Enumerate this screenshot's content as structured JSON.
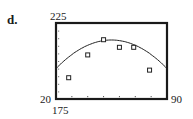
{
  "figure": {
    "part_label": "d.",
    "y_max_label": "225",
    "x_min_label": "20",
    "x_max_label": "90",
    "y_min_label": "175"
  },
  "chart_data": {
    "type": "scatter",
    "title": "",
    "xlabel": "",
    "ylabel": "",
    "xlim": [
      20,
      90
    ],
    "ylim": [
      175,
      225
    ],
    "x_ticks": [
      30,
      40,
      50,
      60,
      70,
      80
    ],
    "grid": false,
    "series": [
      {
        "name": "data points",
        "marker": "square",
        "x": [
          28,
          40,
          50,
          60,
          69,
          79
        ],
        "y": [
          189,
          204,
          214,
          209,
          209,
          194
        ]
      },
      {
        "name": "fitted quadratic curve",
        "style": "line",
        "x": [
          20,
          30,
          40,
          50,
          55,
          60,
          70,
          80,
          90
        ],
        "y": [
          175,
          194,
          206,
          212,
          213,
          212,
          206,
          194,
          175
        ]
      }
    ]
  }
}
